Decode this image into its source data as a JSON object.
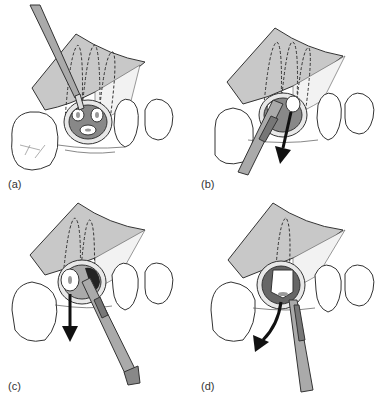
{
  "figure": {
    "panels": [
      {
        "label": "(a)",
        "step": "Bur sectioning the molar crown into root segments under a reflected flap"
      },
      {
        "label": "(b)",
        "step": "Elevator inserted; first root segment elevated (arrow downward)"
      },
      {
        "label": "(c)",
        "step": "Second root segment removed with elevator (arrow downward)"
      },
      {
        "label": "(d)",
        "step": "Final root segment luxated with elevator (curved arrow)"
      }
    ],
    "colors": {
      "flap": "#c8c8c8",
      "outline": "#333333",
      "socket_dark": "#222222",
      "instrument": "#9a9a9a",
      "arrow": "#111111"
    }
  }
}
